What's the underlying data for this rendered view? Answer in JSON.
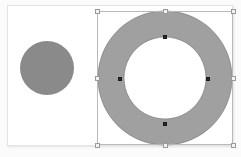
{
  "app": {
    "title": "Vector Canvas",
    "background_color": "#fbfbfb"
  },
  "canvas": {
    "page_color": "#ffffff",
    "page_border_color": "#e3e3e3",
    "page": {
      "x": 7,
      "y": 5,
      "width": 226,
      "height": 141
    }
  },
  "shapes": [
    {
      "id": "circle-left",
      "name": "filled-circle",
      "type": "circle",
      "fill": "#8a8a8a",
      "stroke": "none",
      "cx": 47,
      "cy": 68,
      "r": 27,
      "selected": false
    },
    {
      "id": "donut-right",
      "name": "ring-shape",
      "type": "ring",
      "fill": "#a0a0a0",
      "stroke": "#6f6f6f",
      "stroke_width": 0.6,
      "cx": 165,
      "cy": 78,
      "outer_r": 67,
      "inner_r": 41,
      "selected": true
    }
  ],
  "selection": {
    "label": "selection-bounding-box",
    "border_color": "#b9b9b9",
    "x": 97,
    "y": 11,
    "width": 136,
    "height": 134,
    "handle_fill": "#f2f2f2",
    "handle_border": "#9a9a9a",
    "handles": [
      {
        "name": "handle-top-left",
        "x": 97,
        "y": 11
      },
      {
        "name": "handle-top-center",
        "x": 165,
        "y": 11
      },
      {
        "name": "handle-top-right",
        "x": 233,
        "y": 11
      },
      {
        "name": "handle-middle-left",
        "x": 97,
        "y": 78
      },
      {
        "name": "handle-middle-right",
        "x": 233,
        "y": 78
      },
      {
        "name": "handle-bottom-left",
        "x": 97,
        "y": 145
      },
      {
        "name": "handle-bottom-center",
        "x": 165,
        "y": 145
      },
      {
        "name": "handle-bottom-right",
        "x": 233,
        "y": 145
      }
    ]
  },
  "node_handles": {
    "label": "inner-path-nodes",
    "fill": "#2b2b2b",
    "points": [
      {
        "name": "node-inner-top",
        "x": 165,
        "y": 37
      },
      {
        "name": "node-inner-left",
        "x": 120,
        "y": 79
      },
      {
        "name": "node-inner-right",
        "x": 208,
        "y": 79
      },
      {
        "name": "node-inner-bottom",
        "x": 165,
        "y": 124
      }
    ]
  }
}
